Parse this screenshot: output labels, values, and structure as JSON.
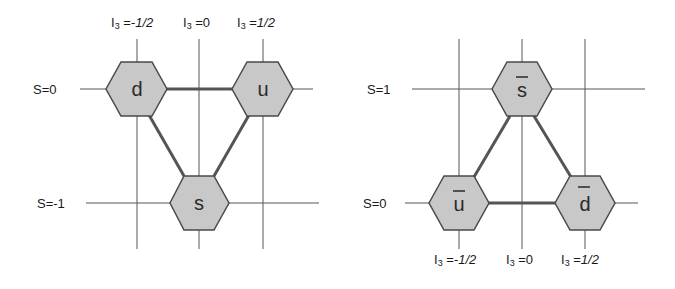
{
  "colors": {
    "grid_line": "#555555",
    "edge_line": "#555555",
    "hex_fill": "#c8c8c8",
    "hex_stroke": "#4a4a4a",
    "text": "#1a1a1a"
  },
  "left_diagram": {
    "name": "quark-triplet",
    "i3_labels": [
      {
        "prefix": "I",
        "sub": "3",
        "eq": " =",
        "value": "-1/2"
      },
      {
        "prefix": "I",
        "sub": "3",
        "eq": " =",
        "value": "0"
      },
      {
        "prefix": "I",
        "sub": "3",
        "eq": " =",
        "value": "1/2"
      }
    ],
    "s_labels": [
      "S=0",
      "S=-1"
    ],
    "nodes": [
      {
        "label": "d",
        "bar": false,
        "i3": "-1/2",
        "s": "0"
      },
      {
        "label": "u",
        "bar": false,
        "i3": "1/2",
        "s": "0"
      },
      {
        "label": "s",
        "bar": false,
        "i3": "0",
        "s": "-1"
      }
    ]
  },
  "right_diagram": {
    "name": "antiquark-triplet",
    "i3_labels": [
      {
        "prefix": "I",
        "sub": "3",
        "eq": " =",
        "value": "-1/2"
      },
      {
        "prefix": "I",
        "sub": "3",
        "eq": " =",
        "value": "0"
      },
      {
        "prefix": "I",
        "sub": "3",
        "eq": " =",
        "value": "1/2"
      }
    ],
    "s_labels": [
      "S=1",
      "S=0"
    ],
    "nodes": [
      {
        "label": "s",
        "bar": true,
        "i3": "0",
        "s": "1"
      },
      {
        "label": "u",
        "bar": true,
        "i3": "-1/2",
        "s": "0"
      },
      {
        "label": "d",
        "bar": true,
        "i3": "1/2",
        "s": "0"
      }
    ]
  }
}
